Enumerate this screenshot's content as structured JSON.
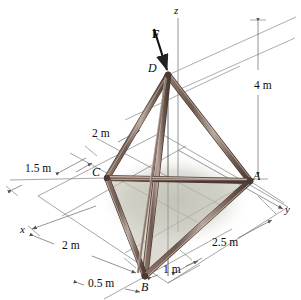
{
  "figure": {
    "background": "#ffffff",
    "strut_color": "#6f5a50",
    "strut_highlight": "#b9a79d",
    "strut_dark": "#4a3a32",
    "line_color": "#6b6b6b",
    "plate_color": "#c9c9bc",
    "shadow_color": "#d3d3c9"
  },
  "axes": [
    {
      "name": "z-axis",
      "label": "z",
      "x": 174,
      "y": 6
    },
    {
      "name": "y-axis",
      "label": "y",
      "x": 285,
      "y": 205
    },
    {
      "name": "x-axis",
      "label": "x",
      "x": 20,
      "y": 224
    }
  ],
  "points": [
    {
      "name": "point-d",
      "label": "D",
      "x": 148,
      "y": 62,
      "px": 168,
      "py": 75
    },
    {
      "name": "point-c",
      "label": "C",
      "x": 92,
      "y": 166,
      "px": 107,
      "py": 178
    },
    {
      "name": "point-a",
      "label": "A",
      "x": 253,
      "y": 170,
      "px": 250,
      "py": 181
    },
    {
      "name": "point-b",
      "label": "B",
      "x": 141,
      "y": 281,
      "px": 145,
      "py": 276
    }
  ],
  "force": {
    "name": "force-f",
    "label": "F",
    "label_x": 152,
    "label_y": 28,
    "tail_x": 170,
    "tail_y": 26,
    "tip_x": 168,
    "tip_y": 73
  },
  "dimensions": [
    {
      "name": "dim-4m",
      "label": "4 m",
      "x": 254,
      "y": 80,
      "value": 4,
      "unit": "m"
    },
    {
      "name": "dim-2m-upper",
      "label": "2 m",
      "x": 92,
      "y": 128,
      "value": 2,
      "unit": "m"
    },
    {
      "name": "dim-1p5m",
      "label": "1.5 m",
      "x": 25,
      "y": 163,
      "value": 1.5,
      "unit": "m"
    },
    {
      "name": "dim-2m-lower",
      "label": "2 m",
      "x": 62,
      "y": 240,
      "value": 2,
      "unit": "m"
    },
    {
      "name": "dim-2p5m",
      "label": "2.5 m",
      "x": 212,
      "y": 237,
      "value": 2.5,
      "unit": "m"
    },
    {
      "name": "dim-0p5m",
      "label": "0.5 m",
      "x": 88,
      "y": 278,
      "value": 0.5,
      "unit": "m"
    },
    {
      "name": "dim-1m",
      "label": "1 m",
      "x": 163,
      "y": 264,
      "value": 1,
      "unit": "m"
    }
  ]
}
